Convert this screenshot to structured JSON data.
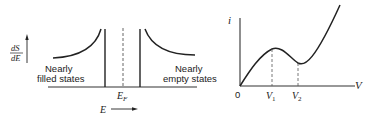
{
  "left_diagram": {
    "ylabel_num": "dS",
    "ylabel_den": "dE",
    "label_filled_line1": "Nearly",
    "label_filled_line2": "filled states",
    "label_empty_line1": "Nearly",
    "label_empty_line2": "empty states",
    "fermi_label": "E",
    "fermi_sub": "F",
    "xlabel": "E"
  },
  "right_diagram": {
    "ylabel": "i",
    "xlabel": "V",
    "origin_label": "0",
    "v1_label": "V",
    "v1_sub": "1",
    "v2_label": "V",
    "v2_sub": "2"
  },
  "colors": {
    "line": "#222222",
    "background": "#ffffff"
  }
}
